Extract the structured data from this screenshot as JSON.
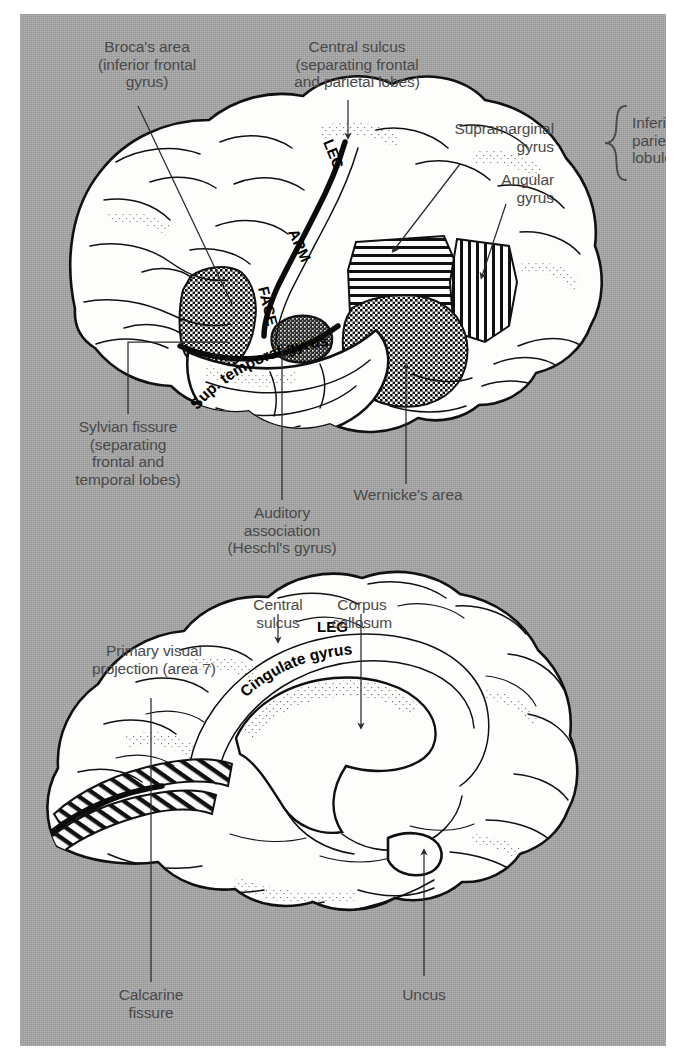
{
  "figure": {
    "background_color": "#ffffff",
    "plate_color": "#a8a8a8",
    "label_color": "#4a4a4a",
    "ink_color": "#111111"
  },
  "lateral_view": {
    "name": "Lateral view of left cerebral hemisphere",
    "labels": {
      "brocas_area": "Broca's area\n(inferior frontal\ngyrus)",
      "central_sulcus": "Central sulcus\n(separating frontal\nand parietal lobes)",
      "supramarginal_gyrus": "Supramarginal\ngyrus",
      "angular_gyrus": "Angular\ngyrus",
      "inferior_parietal_lobule": "Inferior\nparietal\nlobule",
      "sylvian_fissure": "Sylvian fissure\n(separating\nfrontal and\ntemporal lobes)",
      "auditory_association": "Auditory\nassociation\n(Heschl's gyrus)",
      "wernickes_area": "Wernicke's area"
    },
    "inline_labels": {
      "leg": "LEG",
      "arm": "ARM",
      "face": "FACE",
      "sup_temporal_gyrus": "Sup. temporal gyrus"
    },
    "shaded_regions": [
      {
        "name": "Broca's area",
        "pattern": "dotted-checker"
      },
      {
        "name": "Supramarginal gyrus",
        "pattern": "horizontal-hatch"
      },
      {
        "name": "Angular gyrus",
        "pattern": "vertical-hatch"
      },
      {
        "name": "Wernicke's area",
        "pattern": "dotted-checker"
      },
      {
        "name": "Heschl's gyrus",
        "pattern": "dense-scribble"
      }
    ]
  },
  "medial_view": {
    "name": "Medial view of right cerebral hemisphere",
    "labels": {
      "central_sulcus": "Central\nsulcus",
      "corpus_callosum": "Corpus\ncallosum",
      "primary_visual_projection": "Primary visual\nprojection (area 7)",
      "calcarine_fissure": "Calcarine\nfissure",
      "uncus": "Uncus"
    },
    "inline_labels": {
      "leg": "LEG",
      "cingulate_gyrus": "Cingulate gyrus"
    },
    "shaded_regions": [
      {
        "name": "Primary visual projection",
        "pattern": "diagonal-hatch"
      }
    ]
  }
}
